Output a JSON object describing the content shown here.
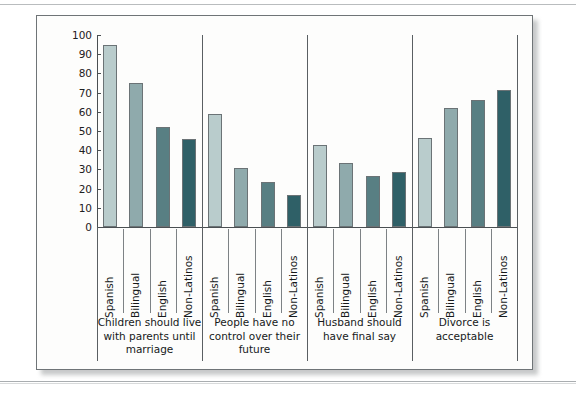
{
  "figure": {
    "caption_band_present": true
  },
  "chart_data": {
    "type": "bar",
    "title": "",
    "subtitle": "",
    "xlabel": "",
    "ylabel": "",
    "ylim": [
      0,
      100
    ],
    "ytick_step": 10,
    "yticks": [
      0,
      10,
      20,
      30,
      40,
      50,
      60,
      70,
      80,
      90,
      100
    ],
    "ytick_labels": [
      "0",
      "10",
      "20",
      "30",
      "40",
      "50",
      "60",
      "70",
      "80",
      "90",
      "100"
    ],
    "grid": false,
    "legend_position": "none",
    "group_axis_label": "",
    "categories": [
      "Spanish",
      "Bilingual",
      "English",
      "Non-Latinos"
    ],
    "category_colors": [
      "#b9cccc",
      "#8faaac",
      "#587f83",
      "#2f6067"
    ],
    "groups": [
      {
        "label": "Children should live\nwith parents until\nmarriage",
        "values": [
          95,
          75,
          52,
          46
        ]
      },
      {
        "label": "People have no\ncontrol over their\nfuture",
        "values": [
          59,
          30.5,
          23.5,
          16.5
        ]
      },
      {
        "label": "Husband should\nhave final say",
        "values": [
          42.5,
          33.5,
          26.5,
          28.5
        ]
      },
      {
        "label": "Divorce is\nacceptable",
        "values": [
          46.5,
          62,
          66,
          71.5
        ]
      }
    ],
    "series": [
      {
        "name": "Spanish",
        "values": [
          95,
          59,
          42.5,
          46.5
        ]
      },
      {
        "name": "Bilingual",
        "values": [
          75,
          30.5,
          33.5,
          62
        ]
      },
      {
        "name": "English",
        "values": [
          52,
          23.5,
          26.5,
          66
        ]
      },
      {
        "name": "Non-Latinos",
        "values": [
          46,
          16.5,
          28.5,
          71.5
        ]
      }
    ]
  }
}
